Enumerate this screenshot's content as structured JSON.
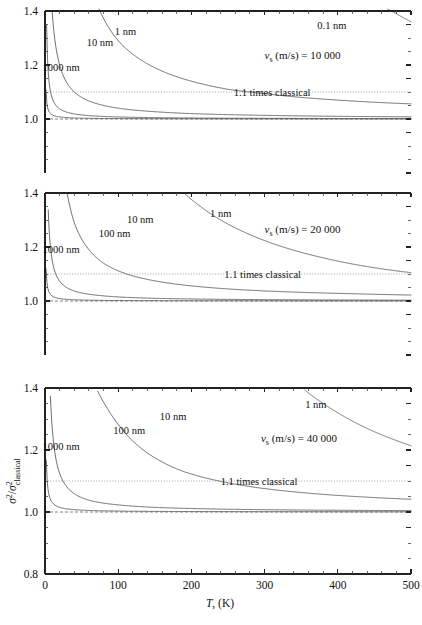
{
  "figure": {
    "kind": "multi-panel-line-chart",
    "panel_count": 3,
    "axis": {
      "x_label_var": "T",
      "x_label_rest": ", (K)",
      "x_ticks": [
        "0",
        "100",
        "200",
        "300",
        "400",
        "500"
      ],
      "x_min": 0,
      "x_max": 500,
      "x_minor_step": 20,
      "y_ticks_top": [
        "1.0",
        "1.2",
        "1.4"
      ],
      "y_ticks_bottom": [
        "0.8",
        "1.0",
        "1.2",
        "1.4"
      ],
      "y_min_upper": 0.8,
      "y_max_upper": 1.4,
      "y_minor_step": 0.05,
      "y_label_num": "σ",
      "y_label_sup": "2",
      "y_label_sep": "/",
      "y_label_den": "σ",
      "y_label_den_sub": "classical"
    },
    "reference": {
      "dotted_label": "1.1 times classical",
      "dotted_value": 1.1,
      "dashed_value": 1.0
    },
    "colors": {
      "axis": "#222222",
      "curve": "#555555",
      "reference_dotted": "#999999",
      "reference_dashed": "#777777",
      "background": "#ffffff"
    }
  },
  "chart_data": {
    "type": "line",
    "title": "",
    "xlabel": "T, (K)",
    "ylabel": "sigma^2 / sigma^2_classical",
    "xlim": [
      0,
      500
    ],
    "grid": false,
    "legend": "inline-curve-labels",
    "panels": [
      {
        "id": "panel-top",
        "vs_var": "ν",
        "vs_sub": "s",
        "vs_text": " (m/s) = 10 000",
        "vs_value": 10000,
        "ylim": [
          0.8,
          1.4
        ],
        "y_visible_ticks": [
          "1.0",
          "1.2",
          "1.4"
        ],
        "ref_label": "1.1 times classical",
        "series": [
          {
            "name": "0.1 nm",
            "thickness_nm": 0.1,
            "label_x": 392,
            "label_y": 18,
            "x": [
              300,
              320,
              340,
              360,
              380,
              400,
              420,
              440,
              460,
              480,
              500
            ],
            "y": [
              1.92,
              1.82,
              1.74,
              1.67,
              1.61,
              1.55,
              1.5,
              1.46,
              1.42,
              1.39,
              1.36
            ]
          },
          {
            "name": "1 nm",
            "thickness_nm": 1,
            "label_x": 110,
            "label_y": 24,
            "x": [
              25,
              50,
              75,
              100,
              150,
              200,
              250,
              300,
              350,
              400,
              450,
              500
            ],
            "y": [
              2.35,
              1.62,
              1.4,
              1.29,
              1.19,
              1.14,
              1.11,
              1.094,
              1.08,
              1.07,
              1.062,
              1.056
            ]
          },
          {
            "name": "10 nm",
            "thickness_nm": 10,
            "label_x": 75,
            "label_y": 35,
            "x": [
              5,
              10,
              20,
              40,
              60,
              100,
              150,
              200,
              300,
              400,
              500
            ],
            "y": [
              1.8,
              1.39,
              1.2,
              1.1,
              1.067,
              1.04,
              1.027,
              1.02,
              1.0135,
              1.01,
              1.008
            ]
          },
          {
            "name": "100 nm",
            "thickness_nm": 100,
            "label_x": null,
            "label_y": null,
            "x": [
              1,
              2,
              4,
              8,
              15,
              30,
              60,
              120,
              250,
              400,
              500
            ],
            "y": [
              1.77,
              1.38,
              1.19,
              1.095,
              1.05,
              1.025,
              1.0125,
              1.0063,
              1.003,
              1.0019,
              1.0015
            ]
          },
          {
            "name": "1000 nm",
            "thickness_nm": 1000,
            "label_x": 22,
            "label_y": 60,
            "x": [
              0.2,
              0.5,
              1,
              2,
              5,
              10,
              30,
              80,
              200,
              400,
              500
            ],
            "y": [
              1.72,
              1.3,
              1.15,
              1.075,
              1.03,
              1.015,
              1.005,
              1.0019,
              1.0008,
              1.0004,
              1.0003
            ]
          }
        ]
      },
      {
        "id": "panel-middle",
        "vs_var": "ν",
        "vs_sub": "s",
        "vs_text": " (m/s) = 20 000",
        "vs_value": 20000,
        "ylim": [
          0.8,
          1.4
        ],
        "y_visible_ticks": [
          "1.0",
          "1.2",
          "1.4"
        ],
        "ref_label": "1.1 times classical",
        "series": [
          {
            "name": "1 nm",
            "thickness_nm": 1,
            "label_x": 240,
            "label_y": 24,
            "x": [
              190,
              210,
              240,
              270,
              300,
              340,
              380,
              420,
              460,
              500
            ],
            "y": [
              1.4,
              1.355,
              1.3,
              1.258,
              1.224,
              1.188,
              1.16,
              1.137,
              1.119,
              1.105
            ]
          },
          {
            "name": "10 nm",
            "thickness_nm": 10,
            "label_x": 130,
            "label_y": 30,
            "x": [
              18,
              25,
              40,
              60,
              80,
              120,
              160,
              200,
              260,
              340,
              420,
              500
            ],
            "y": [
              1.72,
              1.5,
              1.29,
              1.19,
              1.14,
              1.093,
              1.07,
              1.056,
              1.043,
              1.033,
              1.027,
              1.022
            ]
          },
          {
            "name": "100 nm",
            "thickness_nm": 100,
            "label_x": 95,
            "label_y": 44,
            "x": [
              2,
              4,
              8,
              15,
              25,
              45,
              80,
              150,
              250,
              380,
              500
            ],
            "y": [
              1.74,
              1.37,
              1.185,
              1.098,
              1.059,
              1.033,
              1.019,
              1.01,
              1.006,
              1.004,
              1.003
            ]
          },
          {
            "name": "1000 nm",
            "thickness_nm": 1000,
            "label_x": 22,
            "label_y": 60,
            "x": [
              0.3,
              0.8,
              2,
              5,
              12,
              30,
              80,
              200,
              400,
              500
            ],
            "y": [
              1.55,
              1.22,
              1.09,
              1.036,
              1.015,
              1.006,
              1.0023,
              1.0009,
              1.0005,
              1.0004
            ]
          }
        ]
      },
      {
        "id": "panel-bottom",
        "vs_var": "ν",
        "vs_sub": "s",
        "vs_text": " (m/s) = 40 000",
        "vs_value": 40000,
        "ylim": [
          0.8,
          1.4
        ],
        "y_visible_ticks": [
          "0.8",
          "1.0",
          "1.2",
          "1.4"
        ],
        "ref_label": "1.1 times classical",
        "series": [
          {
            "name": "1 nm",
            "thickness_nm": 1,
            "label_x": 370,
            "label_y": 20,
            "x": [
              355,
              375,
              400,
              425,
              450,
              475,
              500
            ],
            "y": [
              1.393,
              1.358,
              1.32,
              1.287,
              1.259,
              1.235,
              1.214
            ]
          },
          {
            "name": "10 nm",
            "thickness_nm": 10,
            "label_x": 175,
            "label_y": 32,
            "x": [
              72,
              85,
              100,
              125,
              150,
              190,
              230,
              280,
              340,
              410,
              500
            ],
            "y": [
              1.39,
              1.335,
              1.283,
              1.218,
              1.175,
              1.13,
              1.104,
              1.082,
              1.065,
              1.052,
              1.041
            ]
          },
          {
            "name": "100 nm",
            "thickness_nm": 100,
            "label_x": 115,
            "label_y": 46,
            "x": [
              5,
              9,
              15,
              25,
              40,
              65,
              100,
              160,
              250,
              370,
              500
            ],
            "y": [
              1.57,
              1.3,
              1.17,
              1.098,
              1.059,
              1.035,
              1.023,
              1.014,
              1.009,
              1.006,
              1.0045
            ]
          },
          {
            "name": "1000 nm",
            "thickness_nm": 1000,
            "label_x": 22,
            "label_y": 62,
            "x": [
              0.6,
              1.5,
              4,
              10,
              25,
              60,
              150,
              300,
              500
            ],
            "y": [
              1.52,
              1.2,
              1.075,
              1.03,
              1.012,
              1.005,
              1.002,
              1.001,
              1.0006
            ]
          }
        ]
      }
    ]
  }
}
